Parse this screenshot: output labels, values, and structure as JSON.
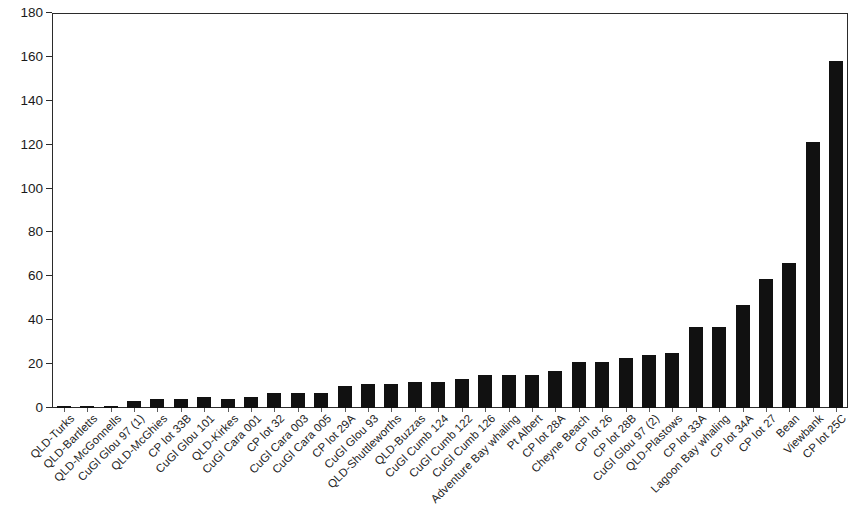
{
  "chart_data": {
    "type": "bar",
    "title": "",
    "subtitle": "",
    "xlabel": "",
    "ylabel": "",
    "ylim": [
      0,
      180
    ],
    "y_ticks": [
      0,
      20,
      40,
      60,
      80,
      100,
      120,
      140,
      160,
      180
    ],
    "grid": false,
    "legend": null,
    "bar_color": "#111111",
    "axis_color": "#2b2b2b",
    "categories": [
      "QLD-Turks",
      "QLD-Bartletts",
      "QLD-McGonnells",
      "CuGl Glou 97 (1)",
      "QLD-McGhies",
      "CP lot 33B",
      "CuGl Glou 101",
      "QLD-Kirkes",
      "CuGl Cara 001",
      "CP lot 32",
      "CuGl Cara 003",
      "CuGl Cara 005",
      "CP lot 29A",
      "CuGl Glou 93",
      "QLD-Shuttleworths",
      "QLD-Buzzas",
      "CuGl Cumb 124",
      "CuGl Cumb 122",
      "CuGl Cumb 126",
      "Adventure Bay whaling",
      "Pt Albert",
      "CP lot 28A",
      "Cheyne Beach",
      "CP lot 26",
      "CP lot 28B",
      "CuGl Glou 97 (2)",
      "QLD-Plastows",
      "CP lot 33A",
      "Lagoon Bay whaling",
      "CP lot 34A",
      "CP lot 27",
      "Bean",
      "Viewbank",
      "CP lot 25C"
    ],
    "values": [
      1,
      1,
      1,
      3,
      4,
      4,
      5,
      4,
      5,
      7,
      7,
      7,
      10,
      11,
      11,
      12,
      12,
      13,
      15,
      15,
      15,
      17,
      21,
      21,
      23,
      24,
      25,
      37,
      37,
      47,
      59,
      66,
      121,
      158
    ]
  }
}
